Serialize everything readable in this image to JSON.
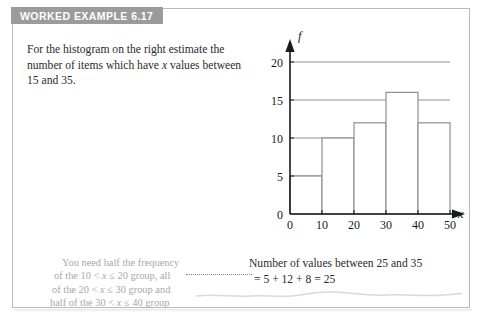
{
  "header": {
    "title": "WORKED EXAMPLE 6.17"
  },
  "question": {
    "line1": "For the histogram on the right estimate the",
    "line2_pre": "number of items which have ",
    "line2_var": "x",
    "line2_post": " values between",
    "line3": "15 and 35."
  },
  "hint_note": {
    "line1": "You need half the frequency",
    "line2_a": "of the 10 < ",
    "line2_var": "x",
    "line2_b": " ≤ 20 group, all",
    "line3_a": "of the 20 < ",
    "line3_var": "x",
    "line3_b": " ≤ 30 group and",
    "line4_a": "half of the 30 < ",
    "line4_var": "x",
    "line4_b": " ≤ 40 group"
  },
  "answer": {
    "line1": "Number of values between 25 and 35",
    "line2": "= 5 + 12 + 8 = 25"
  },
  "chart_data": {
    "type": "bar",
    "title": "",
    "xlabel": "x",
    "ylabel": "f",
    "categories": [
      "0-10",
      "10-20",
      "20-30",
      "30-40",
      "40-50"
    ],
    "bin_edges": [
      0,
      10,
      20,
      30,
      40,
      50
    ],
    "values": [
      5,
      10,
      12,
      16,
      12
    ],
    "xlim": [
      0,
      50
    ],
    "ylim": [
      0,
      20
    ],
    "xticks": [
      0,
      10,
      20,
      30,
      40,
      50
    ],
    "yticks": [
      0,
      5,
      10,
      15,
      20
    ],
    "xtick_labels": [
      "0",
      "10",
      "20",
      "30",
      "40",
      "50"
    ],
    "ytick_labels": [
      "0",
      "5",
      "10",
      "15",
      "20"
    ],
    "grid": true,
    "gridlines_y": [
      5,
      10,
      15,
      20
    ],
    "legend": "none",
    "axis_arrows": true,
    "bar_fill": "#ffffff",
    "bar_stroke": "#8f8f8f",
    "axis_color": "#1a1a1a"
  },
  "colors": {
    "header_bg": "#9b9b9b",
    "header_text": "#ffffff",
    "panel_border": "#b9b9b9",
    "body_text": "#2b2b2b",
    "hint_text": "#a8a8a8",
    "grid": "#8f8f8f"
  }
}
